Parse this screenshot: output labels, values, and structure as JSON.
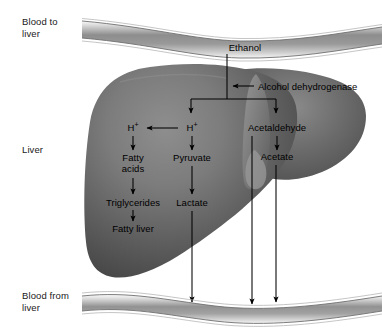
{
  "figure": {
    "regions": {
      "blood_to_liver": "Blood to\nliver",
      "liver": "Liver",
      "blood_from_liver": "Blood from\nliver"
    },
    "colors": {
      "liver_fill_light": "#8f8f8f",
      "liver_fill_dark": "#3c3c3c",
      "vessel_fill_light": "#f2f2f2",
      "vessel_fill_mid": "#8c8c8c",
      "vessel_outline": "#6e6e6e",
      "arrow": "#000000",
      "text": "#000000",
      "background": "#ffffff"
    },
    "nodes": [
      {
        "id": "ethanol",
        "label": "Ethanol",
        "x": 245,
        "y": 48
      },
      {
        "id": "h-plus-left",
        "label": "H+",
        "x": 133,
        "y": 128
      },
      {
        "id": "h-plus-center",
        "label": "H+",
        "x": 192,
        "y": 128
      },
      {
        "id": "acetaldehyde",
        "label": "Acetaldehyde",
        "x": 277,
        "y": 128
      },
      {
        "id": "fatty-acids",
        "label": "Fatty\nacids",
        "x": 133,
        "y": 163
      },
      {
        "id": "pyruvate",
        "label": "Pyruvate",
        "x": 192,
        "y": 158
      },
      {
        "id": "acetate",
        "label": "Acetate",
        "x": 277,
        "y": 157
      },
      {
        "id": "triglycerides",
        "label": "Triglycerides",
        "x": 133,
        "y": 203
      },
      {
        "id": "lactate",
        "label": "Lactate",
        "x": 192,
        "y": 203
      },
      {
        "id": "fatty-liver",
        "label": "Fatty liver",
        "x": 133,
        "y": 229
      }
    ],
    "enzyme": {
      "id": "alcohol-dehydrogenase",
      "label": "Alcohol dehydrogenase",
      "x": 256,
      "y": 86,
      "arrow_from_x": 254,
      "arrow_to_x": 231,
      "arrow_y": 86
    },
    "flows": [
      {
        "from": "ethanol",
        "to": "branch-bar",
        "type": "vertical-stem"
      },
      {
        "from": "branch-bar",
        "to": "h-plus-center",
        "type": "arrow-down"
      },
      {
        "from": "branch-bar",
        "to": "acetaldehyde",
        "type": "arrow-down"
      },
      {
        "from": "h-plus-center",
        "to": "h-plus-left",
        "type": "arrow-left"
      },
      {
        "from": "h-plus-left",
        "to": "fatty-acids",
        "type": "arrow-down"
      },
      {
        "from": "h-plus-center",
        "to": "pyruvate",
        "type": "arrow-down"
      },
      {
        "from": "acetaldehyde",
        "to": "acetate",
        "type": "arrow-down"
      },
      {
        "from": "fatty-acids",
        "to": "triglycerides",
        "type": "arrow-down"
      },
      {
        "from": "pyruvate",
        "to": "lactate",
        "type": "arrow-down"
      },
      {
        "from": "triglycerides",
        "to": "fatty-liver",
        "type": "arrow-down"
      },
      {
        "from": "lactate",
        "to": "blood-from-liver",
        "type": "arrow-down-long"
      },
      {
        "from": "acetaldehyde",
        "to": "blood-from-liver",
        "type": "arrow-down-long"
      },
      {
        "from": "acetate",
        "to": "blood-from-liver",
        "type": "arrow-down-long"
      }
    ]
  }
}
